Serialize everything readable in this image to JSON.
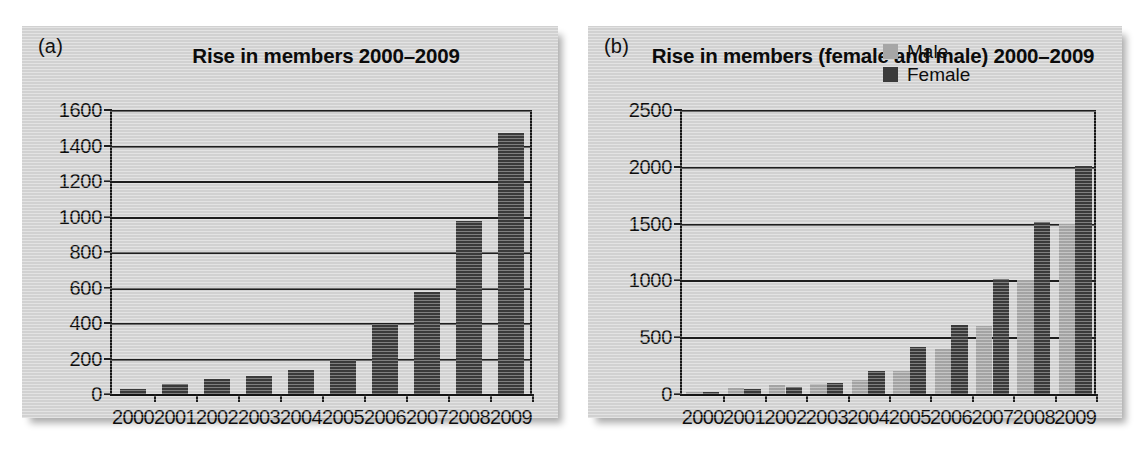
{
  "figure": {
    "background": "#ffffff",
    "panel_background": "#d4d4d4",
    "bar_dark_color": "#3b3b3b",
    "bar_light_color": "#a6a6a6",
    "axis_color": "#1d1d1d"
  },
  "panels": [
    {
      "label": "(a)"
    },
    {
      "label": "(b)"
    }
  ],
  "chart_data": [
    {
      "type": "bar",
      "panel": "(a)",
      "title": "Rise in members 2000–2009",
      "xlabel": "",
      "ylabel": "",
      "categories": [
        "2000",
        "2001",
        "2002",
        "2003",
        "2004",
        "2005",
        "2006",
        "2007",
        "2008",
        "2009"
      ],
      "values": [
        30,
        55,
        85,
        100,
        135,
        190,
        395,
        575,
        975,
        1470
      ],
      "series": [
        {
          "name": "Members",
          "color": "#3b3b3b",
          "values": [
            30,
            55,
            85,
            100,
            135,
            190,
            395,
            575,
            975,
            1470
          ]
        }
      ],
      "ylim": [
        0,
        1600
      ],
      "yticks": [
        0,
        200,
        400,
        600,
        800,
        1000,
        1200,
        1400,
        1600
      ],
      "ytick_labels": [
        "0",
        "200",
        "400",
        "600",
        "800",
        "1000",
        "1200",
        "1400",
        "1600"
      ],
      "grid": true,
      "legend": null
    },
    {
      "type": "bar",
      "panel": "(b)",
      "title": "Rise in members (female and male) 2000–2009",
      "xlabel": "",
      "ylabel": "",
      "categories": [
        "2000",
        "2001",
        "2002",
        "2003",
        "2004",
        "2005",
        "2006",
        "2007",
        "2008",
        "2009"
      ],
      "series": [
        {
          "name": "Male",
          "color": "#a6a6a6",
          "values": [
            15,
            50,
            80,
            90,
            120,
            200,
            400,
            600,
            1000,
            1500
          ]
        },
        {
          "name": "Female",
          "color": "#3b3b3b",
          "values": [
            20,
            40,
            60,
            95,
            200,
            410,
            610,
            1010,
            1510,
            2010
          ]
        }
      ],
      "ylim": [
        0,
        2500
      ],
      "yticks": [
        0,
        500,
        1000,
        1500,
        2000,
        2500
      ],
      "ytick_labels": [
        "0",
        "500",
        "1000",
        "1500",
        "2000",
        "2500"
      ],
      "grid": true,
      "legend": {
        "position": "top-right",
        "entries": [
          {
            "label": "Male",
            "color": "#a6a6a6"
          },
          {
            "label": "Female",
            "color": "#3b3b3b"
          }
        ]
      }
    }
  ]
}
